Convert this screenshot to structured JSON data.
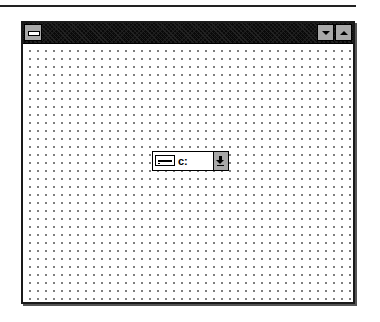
{
  "window": {
    "title": "",
    "system_menu_icon": "system-menu-icon",
    "buttons": [
      {
        "name": "minimize",
        "icon": "down-triangle"
      },
      {
        "name": "maximize",
        "icon": "up-triangle"
      }
    ],
    "client_background": "dot-grid",
    "colors": {
      "titlebar": "#0a0a0a",
      "button_face": "#a8a8a8",
      "client": "#ffffff",
      "grid_dot": "#7a7a7a"
    }
  },
  "drive_combo": {
    "icon": "hard-drive-icon",
    "selected_value": "c:",
    "dropdown_icon": "down-arrow-icon"
  }
}
